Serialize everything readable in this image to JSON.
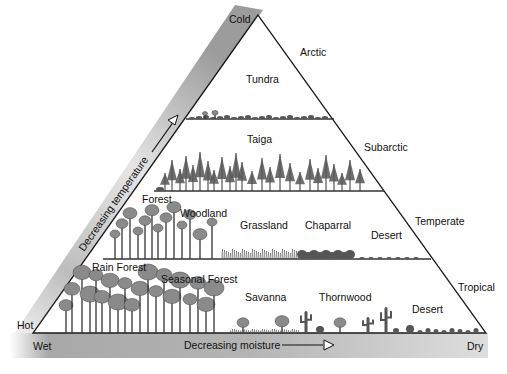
{
  "diagram": {
    "title_hidden": "Biome pyramid: temperature vs moisture",
    "axes": {
      "temperature": {
        "label": "Decreasing temperature",
        "top_end": "Cold",
        "bottom_end": "Hot"
      },
      "moisture": {
        "label": "Decreasing moisture",
        "left_end": "Wet",
        "right_end": "Dry"
      }
    },
    "zones": [
      {
        "name": "Arctic"
      },
      {
        "name": "Subarctic"
      },
      {
        "name": "Temperate"
      },
      {
        "name": "Tropical"
      }
    ],
    "biomes": {
      "arctic": [
        {
          "name": "Tundra"
        }
      ],
      "subarctic": [
        {
          "name": "Taiga"
        }
      ],
      "temperate": [
        {
          "name": "Forest"
        },
        {
          "name": "Woodland"
        },
        {
          "name": "Grassland"
        },
        {
          "name": "Chaparral"
        },
        {
          "name": "Desert"
        }
      ],
      "tropical": [
        {
          "name": "Rain Forest"
        },
        {
          "name": "Seasonal Forest"
        },
        {
          "name": "Savanna"
        },
        {
          "name": "Thornwood"
        },
        {
          "name": "Desert"
        }
      ]
    },
    "colors": {
      "band_dark": "#9a9a9a",
      "band_light": "#e8e8e8",
      "line": "#1a1a1a",
      "vegetation": "#555555",
      "vegetation_light": "#8a8a8a"
    }
  }
}
